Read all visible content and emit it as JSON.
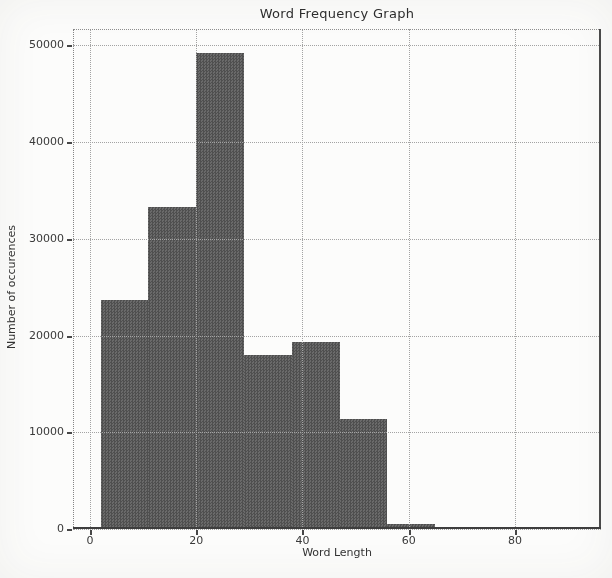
{
  "chart_data": {
    "type": "bar",
    "subtype": "histogram",
    "title": "Word Frequency Graph",
    "xlabel": "Word Length",
    "ylabel": "Number of occurences",
    "bin_edges": [
      2,
      11,
      20,
      29,
      38,
      47,
      56,
      65,
      74,
      83
    ],
    "counts": [
      23700,
      33300,
      49200,
      18000,
      19300,
      11400,
      500,
      0,
      250
    ],
    "xticks": [
      0,
      20,
      40,
      60,
      80
    ],
    "yticks": [
      0,
      10000,
      20000,
      30000,
      40000,
      50000
    ],
    "xlim": [
      -3.2,
      96.2
    ],
    "ylim": [
      0,
      51700
    ],
    "grid": true,
    "grid_line_style": "dotted",
    "legend": "none",
    "bar_color": "#5c5c5c",
    "grid_color": "#a3a3a3",
    "text_color": "#333333",
    "background_color": "#fcfcfb"
  }
}
